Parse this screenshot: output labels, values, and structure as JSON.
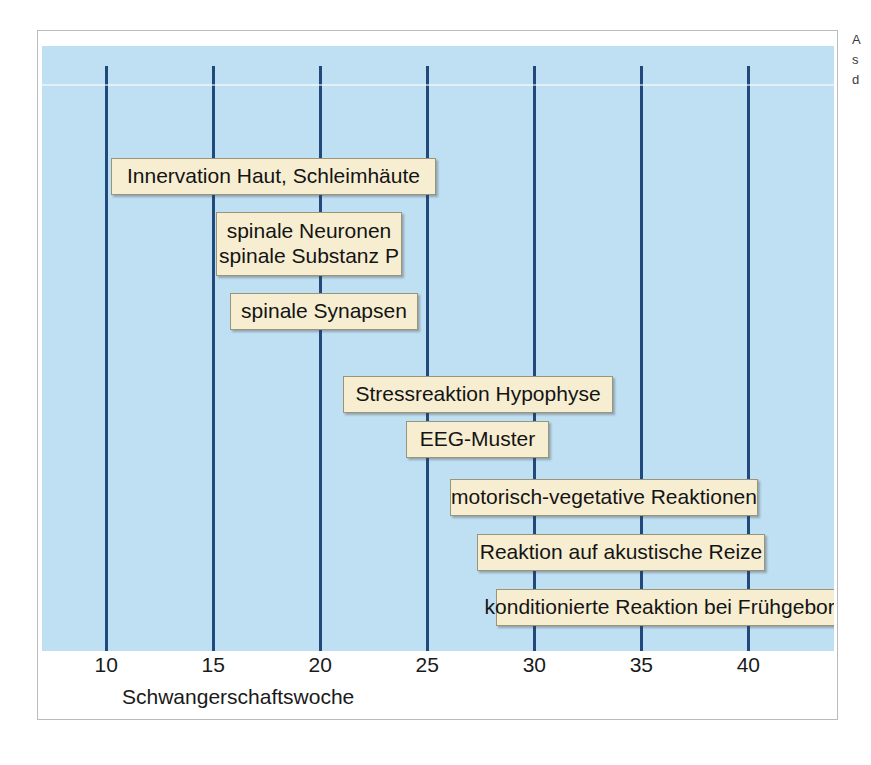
{
  "figure": {
    "axis_title": "Schwangerschaftswoche",
    "background_color": "#bfdff2",
    "gridline_color": "#21497c",
    "box_fill_color": "#f7eed2",
    "box_border_color": "#9a9478",
    "frame_border_color": "#b9bcbe"
  },
  "chart_data": {
    "type": "bar",
    "title": "",
    "subtitle": "",
    "xlabel": "Schwangerschaftswoche",
    "ylabel": "",
    "xlim": [
      7,
      44
    ],
    "grid": true,
    "legend_position": "none",
    "xticks": [
      10,
      15,
      20,
      25,
      30,
      35,
      40
    ],
    "xtick_labels": [
      "10",
      "15",
      "20",
      "25",
      "30",
      "35",
      "40"
    ],
    "categories": [
      "Innervation Haut, Schleimhäute",
      "spinale Neuronen / spinale Substanz P",
      "spinale Synapsen",
      "Stressreaktion Hypophyse",
      "EEG-Muster",
      "motorisch-vegetative Reaktionen",
      "Reaktion auf akustische Reize",
      "konditionierte Reaktion bei Frühgeborenen"
    ],
    "bars": [
      {
        "label": "Innervation Haut, Schleimhäute",
        "start_week": 8.5,
        "end_week": 24.0
      },
      {
        "label": "spinale Neuronen / spinale Substanz P",
        "start_week": 14.0,
        "end_week": 22.5
      },
      {
        "label": "spinale Synapsen",
        "start_week": 15.0,
        "end_week": 24.5
      },
      {
        "label": "Stressreaktion Hypophyse",
        "start_week": 21.5,
        "end_week": 35.0
      },
      {
        "label": "EEG-Muster",
        "start_week": 24.0,
        "end_week": 31.5
      },
      {
        "label": "motorisch-vegetative Reaktionen",
        "start_week": 28.0,
        "end_week": 43.0
      },
      {
        "label": "Reaktion auf akustische Reize",
        "start_week": 29.0,
        "end_week": 42.0
      },
      {
        "label": "konditionierte Reaktion bei Frühgeborenen",
        "start_week": 30.0,
        "end_week": 49.5
      }
    ]
  },
  "milestones": [
    {
      "id": "innervation-haut-schleimhaeute",
      "lines": [
        "Innervation Haut, Schleimhäute"
      ],
      "left": 73,
      "top": 157,
      "width": 325,
      "height": 37
    },
    {
      "id": "spinale-neuronen-substanz-p",
      "lines": [
        "spinale Neuronen",
        "spinale Substanz P"
      ],
      "left": 178,
      "top": 211,
      "width": 186,
      "height": 64
    },
    {
      "id": "spinale-synapsen",
      "lines": [
        "spinale Synapsen"
      ],
      "left": 192,
      "top": 292,
      "width": 188,
      "height": 37
    },
    {
      "id": "stressreaktion-hypophyse",
      "lines": [
        "Stressreaktion Hypophyse"
      ],
      "left": 305,
      "top": 375,
      "width": 270,
      "height": 37
    },
    {
      "id": "eeg-muster",
      "lines": [
        "EEG-Muster"
      ],
      "left": 368,
      "top": 420,
      "width": 143,
      "height": 37
    },
    {
      "id": "motorisch-vegetative-reaktionen",
      "lines": [
        "motorisch-vegetative Reaktionen"
      ],
      "left": 412,
      "top": 478,
      "width": 308,
      "height": 37
    },
    {
      "id": "reaktion-auf-akustische-reize",
      "lines": [
        "Reaktion auf akustische Reize"
      ],
      "left": 439,
      "top": 533,
      "width": 288,
      "height": 37
    },
    {
      "id": "konditionierte-reaktion-bei-fruehgeborenen",
      "lines": [
        "konditionierte Reaktion bei Frühgeborenen"
      ],
      "left": 458,
      "top": 588,
      "width": 374,
      "height": 37
    }
  ],
  "margin_bleed": {
    "lines": [
      "A",
      "s",
      "d"
    ]
  }
}
